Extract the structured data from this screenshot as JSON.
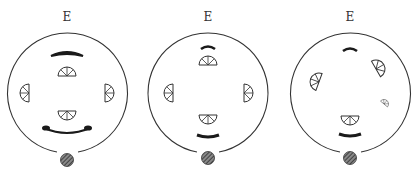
{
  "figure": {
    "panels": [
      {
        "label": "E",
        "cx": 67,
        "cy": 93,
        "r": 60
      },
      {
        "label": "E",
        "cx": 208,
        "cy": 93,
        "r": 60
      },
      {
        "label": "E",
        "cx": 350,
        "cy": 93,
        "r": 60
      }
    ],
    "colors": {
      "stroke": "#333333",
      "fill": "#1a1a1a",
      "background": "#ffffff"
    }
  }
}
